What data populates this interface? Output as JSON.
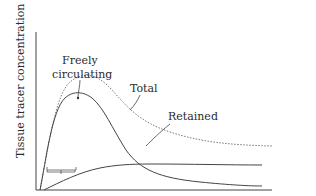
{
  "diagram": {
    "y_axis_label": "Tissue tracer concentration",
    "x_axis_label": "Time",
    "curves": {
      "total": "Total",
      "freely_circulating": "Freely circulating",
      "freely_line1": "Freely",
      "freely_line2": "circulating",
      "retained": "Retained"
    },
    "phases": [
      "A",
      "B",
      "C"
    ],
    "imaging_label": "Imaging",
    "inset": {
      "first_frame_line1": "First frame",
      "first_frame_line2": "(total in tissue)",
      "destruction": "Microbubble destruction",
      "freely_circulating": "Freely circulating"
    }
  }
}
